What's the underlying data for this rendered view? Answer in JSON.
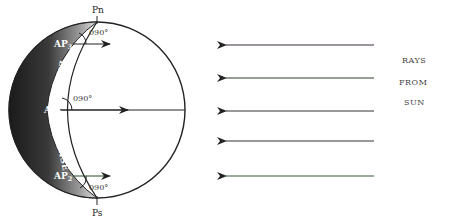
{
  "diagram": {
    "poles": {
      "north": "Pn",
      "south": "Ps"
    },
    "line_label": "LINE OF SUNRISE",
    "line_label_parts": [
      "LINE OF",
      "SUNRISE"
    ],
    "assumed_positions": [
      {
        "id": "AP3",
        "base": "AP",
        "sub": "3",
        "angle": "090°"
      },
      {
        "id": "AP1",
        "base": "AP",
        "sub": "1",
        "angle": "090°"
      },
      {
        "id": "AP2",
        "base": "AP",
        "sub": "2",
        "angle": "090°"
      }
    ],
    "rays": {
      "count": 5,
      "direction": "left",
      "label_lines": [
        "RAYS",
        "FROM",
        "SUN"
      ]
    },
    "colors": {
      "shadow_dark": "#1e1e1e",
      "shadow_light": "#cfcfcf",
      "line": "#222222",
      "ray_green": "#3a5a3a"
    }
  }
}
